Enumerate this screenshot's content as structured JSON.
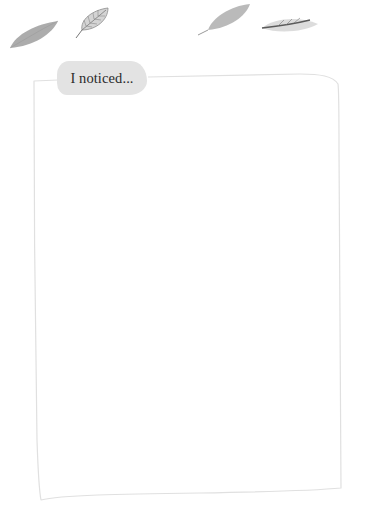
{
  "worksheet": {
    "prompt_label": "I noticed...",
    "writing_area_value": ""
  },
  "decorations": {
    "leaves": [
      "leaf-oval-icon",
      "leaf-veined-icon",
      "leaf-long-icon",
      "leaf-slender-icon"
    ]
  },
  "colors": {
    "background": "#ffffff",
    "label_fill": "#e3e3e3",
    "frame_line": "#e2e2e2",
    "leaf_gray": "#a8a8a8"
  }
}
